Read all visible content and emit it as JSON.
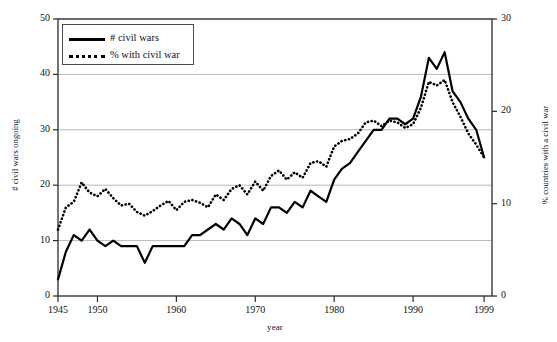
{
  "chart_data": {
    "type": "line",
    "title": "",
    "xlabel": "year",
    "ylabel": "# civil wars ongoing",
    "ylabel_right": "% countries with a civil war",
    "xlim": [
      1945,
      2000
    ],
    "ylim": [
      0,
      50
    ],
    "ylim_right": [
      0,
      30
    ],
    "yticks": [
      0,
      10,
      20,
      30,
      40,
      50
    ],
    "yticks_right": [
      0,
      10,
      20,
      30
    ],
    "xticks": [
      1945,
      1950,
      1960,
      1970,
      1980,
      1990,
      1999
    ],
    "xtick_labels": [
      "1945",
      "1950",
      "1960",
      "1970",
      "1980",
      "1990",
      "1999"
    ],
    "grid": "horizontal",
    "legend_position": "top-left",
    "x": [
      1945,
      1946,
      1947,
      1948,
      1949,
      1950,
      1951,
      1952,
      1953,
      1954,
      1955,
      1956,
      1957,
      1958,
      1959,
      1960,
      1961,
      1962,
      1963,
      1964,
      1965,
      1966,
      1967,
      1968,
      1969,
      1970,
      1971,
      1972,
      1973,
      1974,
      1975,
      1976,
      1977,
      1978,
      1979,
      1980,
      1981,
      1982,
      1983,
      1984,
      1985,
      1986,
      1987,
      1988,
      1989,
      1990,
      1991,
      1992,
      1993,
      1994,
      1995,
      1996,
      1997,
      1998,
      1999
    ],
    "series": [
      {
        "name": "# civil wars",
        "axis": "left",
        "style": "solid",
        "color": "#000000",
        "values": [
          3,
          8,
          11,
          10,
          12,
          10,
          9,
          10,
          9,
          9,
          9,
          6,
          9,
          9,
          9,
          9,
          9,
          11,
          11,
          12,
          13,
          12,
          14,
          13,
          11,
          14,
          13,
          16,
          16,
          15,
          17,
          16,
          19,
          18,
          17,
          21,
          23,
          24,
          26,
          28,
          30,
          30,
          32,
          32,
          31,
          32,
          36,
          43,
          41,
          44,
          37,
          35,
          32,
          30,
          25
        ]
      },
      {
        "name": "% with civil war",
        "axis": "right",
        "style": "dotted",
        "color": "#000000",
        "values": [
          7.2,
          9.6,
          10.2,
          12.3,
          11.2,
          10.8,
          11.6,
          10.6,
          9.8,
          10.0,
          9.1,
          8.7,
          9.2,
          9.8,
          10.3,
          9.3,
          10.2,
          10.4,
          10.1,
          9.6,
          11.0,
          10.4,
          11.6,
          12.0,
          11.0,
          12.4,
          11.4,
          13.0,
          13.6,
          12.6,
          13.4,
          12.8,
          14.4,
          14.6,
          14.0,
          16.2,
          16.8,
          17.0,
          17.6,
          18.8,
          19.0,
          18.4,
          19.0,
          18.8,
          18.2,
          18.6,
          20.4,
          23.2,
          22.8,
          23.4,
          21.0,
          19.4,
          17.6,
          16.4,
          15.0
        ]
      }
    ],
    "legend": [
      {
        "label": "# civil wars",
        "style": "solid"
      },
      {
        "label": "% with civil war",
        "style": "dotted"
      }
    ]
  }
}
